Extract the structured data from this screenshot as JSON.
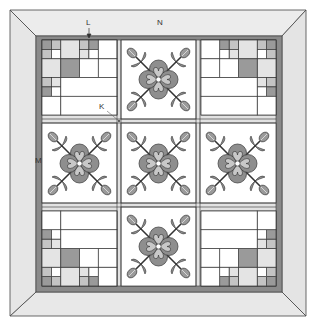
{
  "diagram": {
    "labels": {
      "L": "L",
      "N": "N",
      "K": "K",
      "M": "M"
    },
    "layout": {
      "rows": 3,
      "cols": 3,
      "block_pattern": [
        [
          "patchwork",
          "applique",
          "patchwork"
        ],
        [
          "applique",
          "applique",
          "applique"
        ],
        [
          "patchwork",
          "applique",
          "patchwork"
        ]
      ]
    },
    "colors": {
      "outer_border": "#e6e6e6",
      "inner_border": "#8a8a8a",
      "sashing": "#e2e2e2",
      "dark_patch": "#9a9a9a",
      "medium_patch": "#c4c4c4",
      "light_patch": "#e4e4e4",
      "background": "#ffffff",
      "outline": "#333333"
    }
  }
}
